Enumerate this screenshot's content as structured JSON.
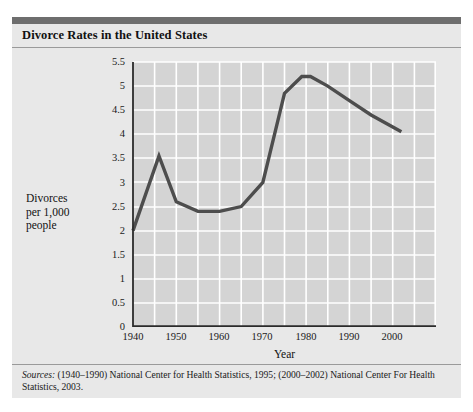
{
  "figure": {
    "title": "Divorce Rates in the United States",
    "sources_label": "Sources:",
    "sources_text": " (1940–1990) National Center for Health Statistics, 1995; (2000–2002) National Center For Health Statistics, 2003."
  },
  "colors": {
    "header_bar": "#6e6e6e",
    "panel_background": "#e8e8e8",
    "plot_background": "#d4d4d4",
    "gridline": "#ffffff",
    "line": "#4d4d4d",
    "axis": "#2b2b2b",
    "text": "#111111"
  },
  "chart_data": {
    "type": "line",
    "title": "Divorce Rates in the United States",
    "xlabel": "Year",
    "ylabel": "Divorces per 1,000 people",
    "ylabel_lines": [
      "Divorces",
      "per 1,000",
      "people"
    ],
    "xlim": [
      1940,
      2010
    ],
    "ylim": [
      0,
      5.5
    ],
    "grid": true,
    "legend": null,
    "xticks": [
      1940,
      1950,
      1960,
      1970,
      1980,
      1990,
      2000
    ],
    "xtick_labels": [
      "1940",
      "1950",
      "1960",
      "1970",
      "1980",
      "1990",
      "2000"
    ],
    "yticks": [
      0,
      0.5,
      1,
      1.5,
      2,
      2.5,
      3,
      3.5,
      4,
      4.5,
      5,
      5.5
    ],
    "ytick_labels": [
      "0",
      "0.5",
      "1",
      "1.5",
      "2",
      "2.5",
      "3",
      "3.5",
      "4",
      "4.5",
      "5",
      "5.5"
    ],
    "x": [
      1940,
      1946,
      1950,
      1955,
      1960,
      1965,
      1970,
      1975,
      1979,
      1981,
      1985,
      1990,
      1995,
      2002
    ],
    "values": [
      2.0,
      3.55,
      2.6,
      2.4,
      2.4,
      2.5,
      3.0,
      4.85,
      5.2,
      5.2,
      5.0,
      4.7,
      4.4,
      4.05
    ],
    "series": [
      {
        "name": "Divorces per 1,000 people",
        "x": [
          1940,
          1946,
          1950,
          1955,
          1960,
          1965,
          1970,
          1975,
          1979,
          1981,
          1985,
          1990,
          1995,
          2002
        ],
        "values": [
          2.0,
          3.55,
          2.6,
          2.4,
          2.4,
          2.5,
          3.0,
          4.85,
          5.2,
          5.2,
          5.0,
          4.7,
          4.4,
          4.05
        ]
      }
    ]
  }
}
